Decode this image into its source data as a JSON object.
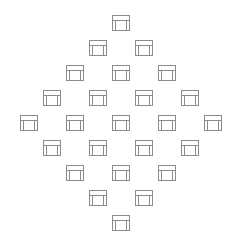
{
  "canvas": {
    "width": 240,
    "height": 243,
    "background": "#ffffff",
    "title": "Stool icon diamond pattern"
  },
  "icon": {
    "name": "stool-icon",
    "label": "stool",
    "stroke_color": "#8c8c8c",
    "stroke_width": 1,
    "fill": "none",
    "size": 22,
    "description": "Square outline stool with horizontal seat band near top and two vertical legs"
  },
  "pattern": {
    "shape": "diamond",
    "total_icons": 25,
    "row_counts": [
      1,
      2,
      3,
      4,
      5,
      4,
      3,
      2,
      1
    ],
    "column_step": 46,
    "row_step": 25,
    "center_x": 117,
    "start_y": 12
  },
  "icons": [
    {
      "id": "icon-r1-c1",
      "row": 1,
      "col": 1,
      "x": 110,
      "y": 12
    },
    {
      "id": "icon-r2-c1",
      "row": 2,
      "col": 1,
      "x": 87,
      "y": 37
    },
    {
      "id": "icon-r2-c2",
      "row": 2,
      "col": 2,
      "x": 133,
      "y": 37
    },
    {
      "id": "icon-r3-c1",
      "row": 3,
      "col": 1,
      "x": 64,
      "y": 62
    },
    {
      "id": "icon-r3-c2",
      "row": 3,
      "col": 2,
      "x": 110,
      "y": 62
    },
    {
      "id": "icon-r3-c3",
      "row": 3,
      "col": 3,
      "x": 156,
      "y": 62
    },
    {
      "id": "icon-r4-c1",
      "row": 4,
      "col": 1,
      "x": 41,
      "y": 87
    },
    {
      "id": "icon-r4-c2",
      "row": 4,
      "col": 2,
      "x": 87,
      "y": 87
    },
    {
      "id": "icon-r4-c3",
      "row": 4,
      "col": 3,
      "x": 133,
      "y": 87
    },
    {
      "id": "icon-r4-c4",
      "row": 4,
      "col": 4,
      "x": 179,
      "y": 87
    },
    {
      "id": "icon-r5-c1",
      "row": 5,
      "col": 1,
      "x": 18,
      "y": 112
    },
    {
      "id": "icon-r5-c2",
      "row": 5,
      "col": 2,
      "x": 64,
      "y": 112
    },
    {
      "id": "icon-r5-c3",
      "row": 5,
      "col": 3,
      "x": 110,
      "y": 112
    },
    {
      "id": "icon-r5-c4",
      "row": 5,
      "col": 4,
      "x": 156,
      "y": 112
    },
    {
      "id": "icon-r5-c5",
      "row": 5,
      "col": 5,
      "x": 202,
      "y": 112
    },
    {
      "id": "icon-r6-c1",
      "row": 6,
      "col": 1,
      "x": 41,
      "y": 137
    },
    {
      "id": "icon-r6-c2",
      "row": 6,
      "col": 2,
      "x": 87,
      "y": 137
    },
    {
      "id": "icon-r6-c3",
      "row": 6,
      "col": 3,
      "x": 133,
      "y": 137
    },
    {
      "id": "icon-r6-c4",
      "row": 6,
      "col": 4,
      "x": 179,
      "y": 137
    },
    {
      "id": "icon-r7-c1",
      "row": 7,
      "col": 1,
      "x": 64,
      "y": 162
    },
    {
      "id": "icon-r7-c2",
      "row": 7,
      "col": 2,
      "x": 110,
      "y": 162
    },
    {
      "id": "icon-r7-c3",
      "row": 7,
      "col": 3,
      "x": 156,
      "y": 162
    },
    {
      "id": "icon-r8-c1",
      "row": 8,
      "col": 1,
      "x": 87,
      "y": 187
    },
    {
      "id": "icon-r8-c2",
      "row": 8,
      "col": 2,
      "x": 133,
      "y": 187
    },
    {
      "id": "icon-r9-c1",
      "row": 9,
      "col": 1,
      "x": 110,
      "y": 212
    }
  ]
}
